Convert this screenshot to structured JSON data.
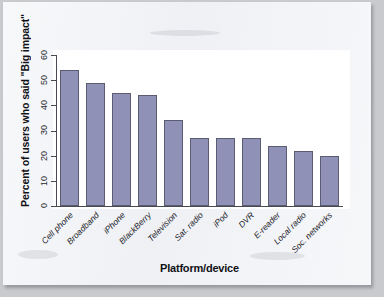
{
  "chart_data": {
    "type": "bar",
    "title": "",
    "xlabel": "Platform/device",
    "ylabel": "Percent of users who said \"Big impact\"",
    "categories": [
      "Cell phone",
      "Broadband",
      "iPhone",
      "BlackBerry",
      "Television",
      "Sat. radio",
      "iPod",
      "DVR",
      "E-reader",
      "Local radio",
      "Soc. networks"
    ],
    "values": [
      54,
      49,
      45,
      44,
      34,
      27,
      27,
      27,
      24,
      22,
      20
    ],
    "ylim": [
      0,
      60
    ],
    "yticks": [
      0,
      10,
      20,
      30,
      40,
      50,
      60
    ],
    "ytick_labels": [
      "0",
      "10",
      "20",
      "30",
      "40",
      "50",
      "60"
    ],
    "grid": false,
    "legend": "none",
    "bar_color": "#9091b6",
    "bar_edge_color": "#5b5b72",
    "axis_color": "#4a4a52",
    "plot_background": "#ffffff",
    "page_background": "#eef0f4"
  }
}
